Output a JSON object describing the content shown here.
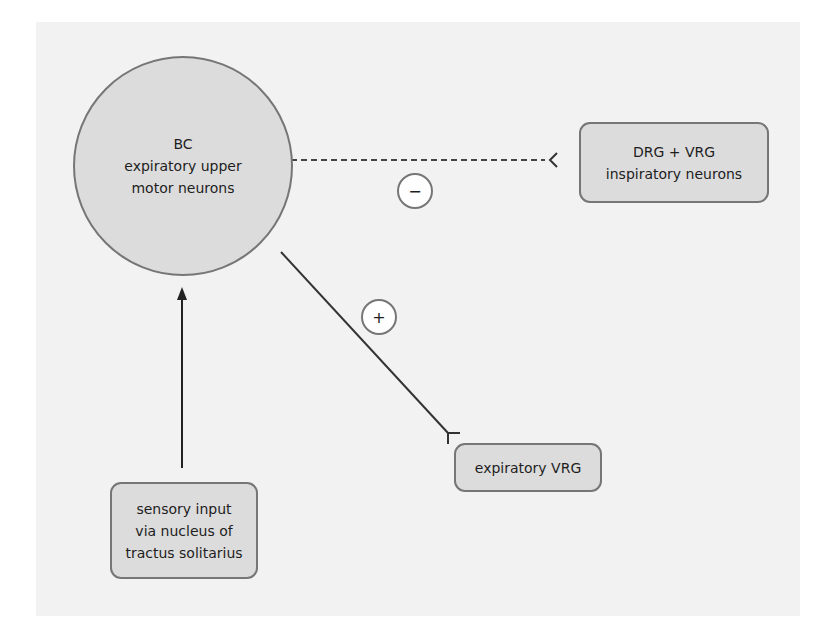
{
  "diagram": {
    "nodes": {
      "bc": {
        "shape": "circle",
        "lines": [
          "BC",
          "expiratory upper",
          "motor neurons"
        ]
      },
      "drg_vrg": {
        "shape": "rounded-box",
        "lines": [
          "DRG + VRG",
          "inspiratory neurons"
        ]
      },
      "expiratory_vrg": {
        "shape": "rounded-box",
        "lines": [
          "expiratory VRG"
        ]
      },
      "sensory": {
        "shape": "rounded-box",
        "lines": [
          "sensory input",
          "via nucleus of",
          "tractus solitarius"
        ]
      }
    },
    "edges": [
      {
        "from": "drg_vrg",
        "to": "bc",
        "style": "dashed",
        "sign": "−",
        "meaning": "inhibitory"
      },
      {
        "from": "bc",
        "to": "expiratory_vrg",
        "style": "solid",
        "sign": "+",
        "meaning": "excitatory"
      },
      {
        "from": "sensory",
        "to": "bc",
        "style": "solid-arrow",
        "sign": ""
      }
    ],
    "signs": {
      "minus": "−",
      "plus": "+"
    },
    "colors": {
      "panel": "#f2f2f2",
      "node_fill": "#dcdcdc",
      "node_border": "#767676",
      "line": "#333333",
      "sign_fill": "#ffffff"
    }
  }
}
